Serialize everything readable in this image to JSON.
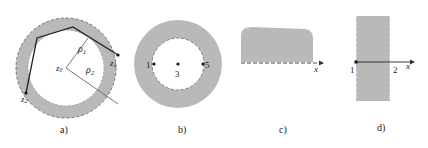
{
  "colors": {
    "fill": "#b9b9b9",
    "stroke": "#555555",
    "ink": "#222222",
    "background": "#ffffff"
  },
  "panels": [
    {
      "id": "a",
      "caption": "a)",
      "description": "Annular region with polygonal path from z2 to z1 around center z0",
      "labels": {
        "rho1": "ρ",
        "rho1_sub": "1",
        "rho2": "ρ",
        "rho2_sub": "2",
        "z0": "z",
        "z0_sub": "0",
        "z1": "z",
        "z1_sub": "1",
        "z2": "z",
        "z2_sub": "2"
      }
    },
    {
      "id": "b",
      "caption": "b)",
      "description": "Annulus with dashed inner boundary and marked points",
      "labels": {
        "p1": "1",
        "p3": "3",
        "p5": "5"
      }
    },
    {
      "id": "c",
      "caption": "c)",
      "description": "Shaded region above the x-axis, dashed boundary on axis",
      "labels": {
        "axis": "x"
      }
    },
    {
      "id": "d",
      "caption": "d)",
      "description": "Vertical strip with dashed boundaries crossed by the x-axis",
      "labels": {
        "p1": "1",
        "p2": "2",
        "axis": "x"
      }
    }
  ]
}
